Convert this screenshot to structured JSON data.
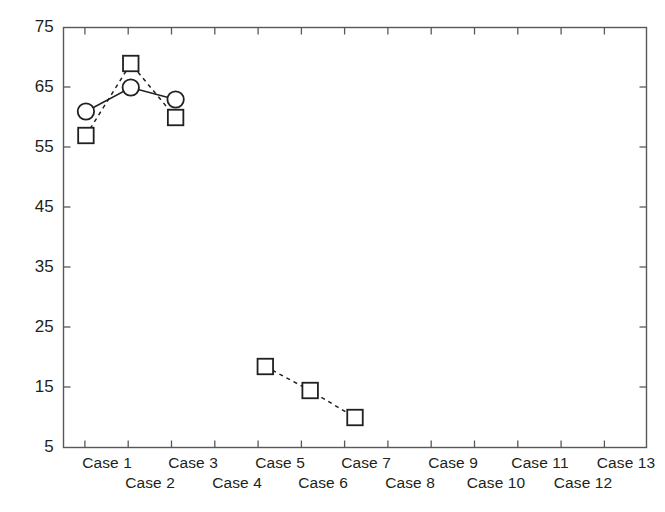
{
  "chart_data": {
    "type": "line",
    "title": "",
    "subtitle": "",
    "xlabel": "",
    "ylabel": "",
    "grid": false,
    "legend": "none",
    "background_color": "#ffffff",
    "axis_color": "#58585a",
    "line_color": "#231f20",
    "marker_face_color": "#ffffff",
    "categories": [
      "Case 1",
      "Case 2",
      "Case 3",
      "Case 4",
      "Case 5",
      "Case 6",
      "Case 7",
      "Case 8",
      "Case 9",
      "Case 10",
      "Case 11",
      "Case 12",
      "Case 13"
    ],
    "x": [
      1,
      2,
      3,
      4,
      5,
      6,
      7,
      8,
      9,
      10,
      11,
      12,
      13
    ],
    "ylim": [
      5,
      75
    ],
    "yticks": [
      5,
      15,
      25,
      35,
      45,
      55,
      65,
      75
    ],
    "ytick_labels": [
      "5",
      "15",
      "25",
      "35",
      "45",
      "55",
      "65",
      "75"
    ],
    "xlim": [
      0.5,
      13.5
    ],
    "series": [
      {
        "name": "series-circles",
        "marker": "circle",
        "linestyle": "solid",
        "values": [
          61,
          65,
          63,
          null,
          null,
          null,
          null,
          null,
          null,
          null,
          null,
          null,
          null
        ],
        "points": [
          {
            "x": 1,
            "y": 61
          },
          {
            "x": 2,
            "y": 65
          },
          {
            "x": 3,
            "y": 63
          }
        ]
      },
      {
        "name": "series-squares",
        "marker": "square",
        "linestyle": "dashed",
        "values": [
          57,
          69,
          60,
          null,
          18.5,
          14.5,
          10,
          null,
          null,
          null,
          null,
          null,
          null
        ],
        "segments": [
          [
            {
              "x": 1,
              "y": 57
            },
            {
              "x": 2,
              "y": 69
            },
            {
              "x": 3,
              "y": 60
            }
          ],
          [
            {
              "x": 5,
              "y": 18.5
            },
            {
              "x": 6,
              "y": 14.5
            },
            {
              "x": 7,
              "y": 10
            }
          ]
        ]
      }
    ]
  },
  "axis": {
    "y_tick_labels": [
      "75",
      "65",
      "55",
      "45",
      "35",
      "25",
      "15",
      "5"
    ],
    "x_tick_labels_top_row": [
      "Case 1",
      "Case 3",
      "Case 5",
      "Case 7",
      "Case 9",
      "Case 11",
      "Case 13"
    ],
    "x_tick_labels_bottom_row": [
      "Case 2",
      "Case 4",
      "Case 6",
      "Case 8",
      "Case 10",
      "Case 12"
    ]
  }
}
